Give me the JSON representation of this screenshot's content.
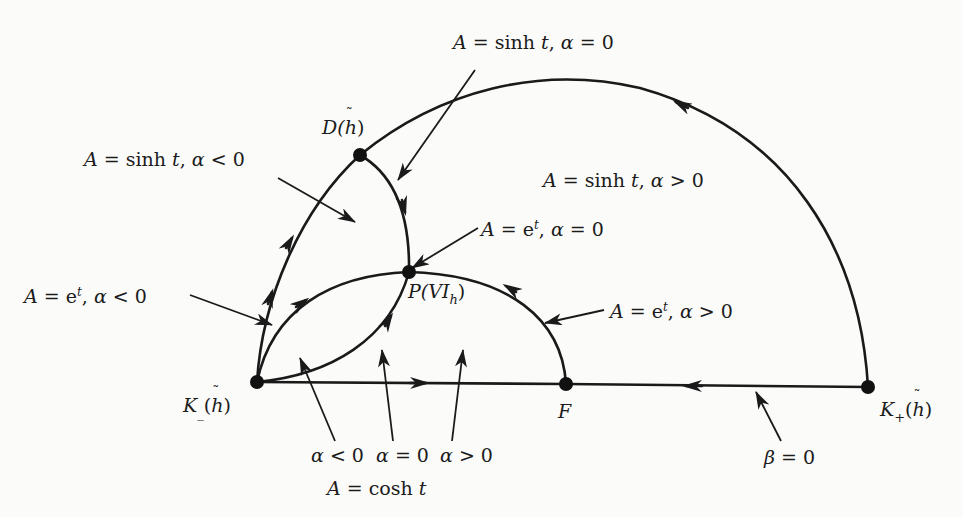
{
  "figure": {
    "nodes": [
      {
        "id": "K_minus",
        "label": "K_(h̃)",
        "x": 257,
        "y": 382
      },
      {
        "id": "D",
        "label": "D(h̃)",
        "x": 360,
        "y": 155
      },
      {
        "id": "P",
        "label": "P(VI_h)",
        "x": 409,
        "y": 272
      },
      {
        "id": "F",
        "label": "F",
        "x": 566,
        "y": 384
      },
      {
        "id": "K_plus",
        "label": "K+(h̃)",
        "x": 868,
        "y": 387
      }
    ],
    "labels": {
      "D": {
        "main": "D(",
        "hat": "h",
        "close": ")"
      },
      "P": {
        "main": "P(VI",
        "sub": "h",
        "close": ")"
      },
      "K_minus": {
        "main": "K",
        "sub": "_",
        "open": "(",
        "hat": "h",
        "close": ")"
      },
      "F": "F",
      "K_plus": {
        "main": "K",
        "sub": "+",
        "open": "(",
        "hat": "h",
        "close": ")"
      }
    },
    "annotations": {
      "sinh_alpha0": {
        "A": "A",
        "eq": " = sinh ",
        "t": "t",
        "comma": ",  ",
        "alpha": "α",
        "rel": " = 0"
      },
      "sinh_alpha_neg": {
        "A": "A",
        "eq": " = sinh ",
        "t": "t",
        "comma": ",  ",
        "alpha": "α",
        "rel": " < 0"
      },
      "sinh_alpha_pos": {
        "A": "A",
        "eq": " = sinh ",
        "t": "t",
        "comma": ",  ",
        "alpha": "α",
        "rel": " > 0"
      },
      "exp_alpha0": {
        "A": "A",
        "eq": " = e",
        "sup": "t",
        "comma": ",  ",
        "alpha": "α",
        "rel": " = 0"
      },
      "exp_alpha_neg": {
        "A": "A",
        "eq": " = e",
        "sup": "t",
        "comma": ",  ",
        "alpha": "α",
        "rel": " < 0"
      },
      "exp_alpha_pos": {
        "A": "A",
        "eq": " = e",
        "sup": "t",
        "comma": ",  ",
        "alpha": "α",
        "rel": " > 0"
      },
      "cosh_neg": {
        "alpha": "α",
        "rel": " < 0"
      },
      "cosh_zero": {
        "alpha": "α",
        "rel": " = 0"
      },
      "cosh_pos": {
        "alpha": "α",
        "rel": " > 0"
      },
      "cosh_label": {
        "A": "A",
        "eq": " = cosh ",
        "t": "t"
      },
      "beta0": {
        "beta": "β",
        "rel": " = 0"
      }
    },
    "colors": {
      "ink": "#1a1a1a",
      "paper": "#fbfbfa"
    }
  }
}
